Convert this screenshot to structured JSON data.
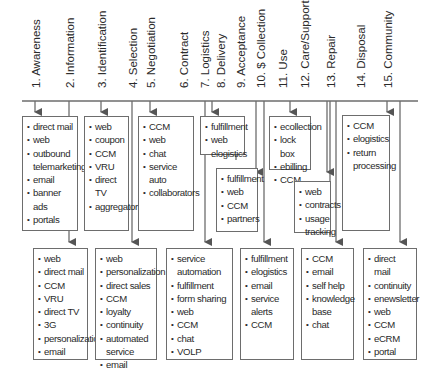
{
  "diagram": {
    "type": "customer-lifecycle-channels",
    "stages": [
      {
        "id": 1,
        "label": "1. Awareness"
      },
      {
        "id": 2,
        "label": "2. Information"
      },
      {
        "id": 3,
        "label": "3. Identification"
      },
      {
        "id": 4,
        "label": "4. Selection"
      },
      {
        "id": 5,
        "label": "5. Negotiation"
      },
      {
        "id": 6,
        "label": "6. Contract"
      },
      {
        "id": 7,
        "label": "7. Logistics"
      },
      {
        "id": 8,
        "label": "8. Delivery"
      },
      {
        "id": 9,
        "label": "9. Acceptance"
      },
      {
        "id": 10,
        "label": "10. $ Collection"
      },
      {
        "id": 11,
        "label": "11. Use"
      },
      {
        "id": 12,
        "label": "12. Care/Support"
      },
      {
        "id": 13,
        "label": "13. Repair"
      },
      {
        "id": 14,
        "label": "14. Disposal"
      },
      {
        "id": 15,
        "label": "15. Community"
      }
    ],
    "boxes": {
      "awareness": [
        "direct mail",
        "web",
        "outbound telemarketing",
        "email",
        "banner ads",
        "portals"
      ],
      "identification": [
        "web",
        "coupon",
        "CCM",
        "VRU",
        "direct TV",
        "aggregators"
      ],
      "negotiation": [
        "CCM",
        "web",
        "chat",
        "service auto",
        "collaborators"
      ],
      "delivery": [
        "fulfillment",
        "web elogistics"
      ],
      "acceptance": [
        "fulfillment",
        "web",
        "CCM",
        "partners"
      ],
      "use": [
        "ecollection",
        "lock box",
        "ebilling",
        "CCM"
      ],
      "care_support": [
        "web",
        "contracts",
        "usage tracking"
      ],
      "disposal": [
        "CCM",
        "elogistics",
        "return processing"
      ],
      "information": [
        "web",
        "direct mail",
        "CCM",
        "VRU",
        "direct TV",
        "3G",
        "personalization",
        "email"
      ],
      "selection": [
        "web",
        "personalization",
        "direct sales",
        "CCM",
        "loyalty",
        "continuity",
        "automated service",
        "email"
      ],
      "logistics": [
        "service automation",
        "fulfillment",
        "form sharing",
        "web",
        "CCM",
        "chat",
        "VOLP"
      ],
      "collection": [
        "fulfillment",
        "elogistics",
        "email",
        "service alerts",
        "CCM"
      ],
      "repair": [
        "CCM",
        "email",
        "self help",
        "knowledge base",
        "chat"
      ],
      "community": [
        "direct mail",
        "continuity",
        "enewsletter",
        "web",
        "CCM",
        "eCRM",
        "portal"
      ]
    }
  }
}
